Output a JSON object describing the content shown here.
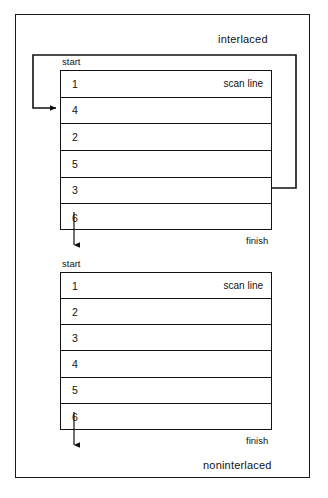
{
  "figure": {
    "background_color": "#ffffff",
    "line_color": "#111111",
    "captions": {
      "interlaced": "interlaced",
      "noninterlaced": "noninterlaced"
    },
    "labels": {
      "start": "start",
      "finish": "finish",
      "scan_line": "scan line"
    }
  },
  "interlaced": {
    "caption": "interlaced",
    "start_label": "start",
    "finish_label": "finish",
    "scan_line_label": "scan line",
    "rows": [
      {
        "number": "1",
        "note": "scan line"
      },
      {
        "number": "4",
        "note": ""
      },
      {
        "number": "2",
        "note": ""
      },
      {
        "number": "5",
        "note": ""
      },
      {
        "number": "3",
        "note": ""
      },
      {
        "number": "6",
        "note": ""
      }
    ]
  },
  "noninterlaced": {
    "caption": "noninterlaced",
    "start_label": "start",
    "finish_label": "finish",
    "scan_line_label": "scan line",
    "rows": [
      {
        "number": "1",
        "note": "scan line"
      },
      {
        "number": "2",
        "note": ""
      },
      {
        "number": "3",
        "note": ""
      },
      {
        "number": "4",
        "note": ""
      },
      {
        "number": "5",
        "note": ""
      },
      {
        "number": "6",
        "note": ""
      }
    ]
  }
}
